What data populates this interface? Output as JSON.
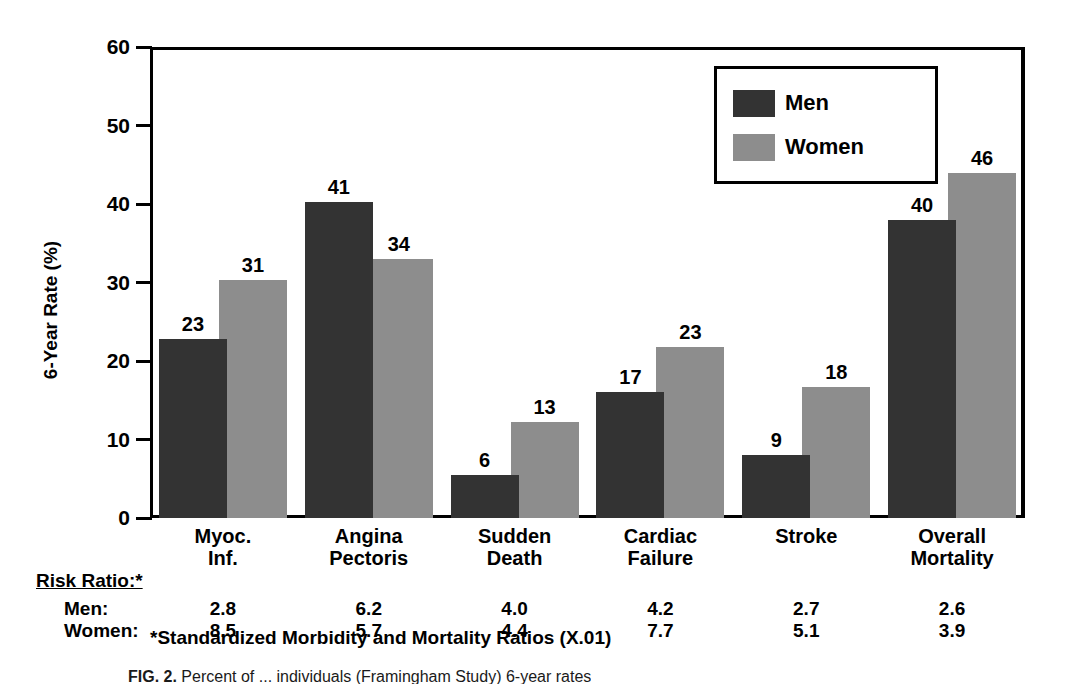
{
  "chart_data": {
    "type": "bar",
    "title": "",
    "xlabel": "",
    "ylabel": "6-Year Rate (%)",
    "ylim": [
      0,
      60
    ],
    "yticks": [
      0,
      10,
      20,
      30,
      40,
      50,
      60
    ],
    "grid": false,
    "legend_position": "top-right",
    "categories": [
      "Myoc.\nInf.",
      "Angina\nPectoris",
      "Sudden\nDeath",
      "Cardiac\nFailure",
      "Stroke",
      "Overall\nMortality"
    ],
    "series": [
      {
        "name": "Men",
        "color": "#333333",
        "values": [
          22.8,
          40.2,
          5.5,
          16.0,
          8.0,
          38.0
        ],
        "labels": [
          "23",
          "41",
          "6",
          "17",
          "9",
          "40"
        ]
      },
      {
        "name": "Women",
        "color": "#8d8d8d",
        "values": [
          30.3,
          33.0,
          12.2,
          21.8,
          16.7,
          44.0
        ],
        "labels": [
          "31",
          "34",
          "13",
          "23",
          "18",
          "46"
        ]
      }
    ]
  },
  "legend": {
    "items": [
      {
        "label": "Men",
        "color": "#333333"
      },
      {
        "label": "Women",
        "color": "#8d8d8d"
      }
    ]
  },
  "risk_ratio": {
    "title": "Risk Ratio:*",
    "rows": [
      {
        "label": "Men:",
        "values": [
          "2.8",
          "6.2",
          "4.0",
          "4.2",
          "2.7",
          "2.6"
        ]
      },
      {
        "label": "Women:",
        "values": [
          "8.5",
          "5.7",
          "4.4",
          "7.7",
          "5.1",
          "3.9"
        ]
      }
    ]
  },
  "footnote": "*Standardized Morbidity and Mortality Ratios (X.01)",
  "caption": {
    "figure_number": "FIG. 2.",
    "text": "Percent of ... individuals (Framingham Study) 6-year rates"
  }
}
